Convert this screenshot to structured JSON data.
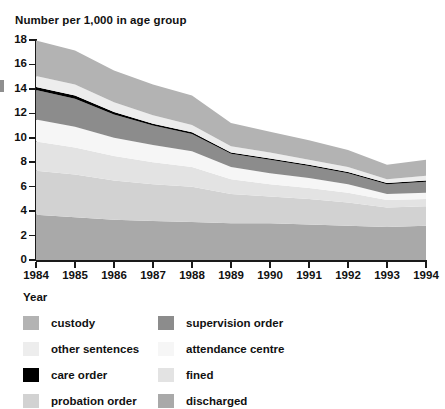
{
  "chart_data": {
    "type": "area",
    "stacked": true,
    "title": "Number per 1,000 in age group",
    "xlabel": "Year",
    "ylabel": "",
    "grid": false,
    "legend_position": "bottom",
    "x": [
      1984,
      1985,
      1986,
      1987,
      1988,
      1989,
      1990,
      1991,
      1992,
      1993,
      1994
    ],
    "categories": [
      "1984",
      "1985",
      "1986",
      "1987",
      "1988",
      "1989",
      "1990",
      "1991",
      "1992",
      "1993",
      "1994"
    ],
    "xlim": [
      1984,
      1994
    ],
    "ylim": [
      0,
      18
    ],
    "yticks": [
      0,
      2,
      4,
      6,
      8,
      10,
      12,
      14,
      16,
      18
    ],
    "series": [
      {
        "name": "discharged",
        "color": "#a9a9a9",
        "values": [
          3.7,
          3.5,
          3.3,
          3.2,
          3.1,
          3.0,
          3.0,
          2.9,
          2.8,
          2.7,
          2.8
        ]
      },
      {
        "name": "probation order",
        "color": "#d2d2d2",
        "values": [
          3.6,
          3.5,
          3.2,
          3.0,
          2.9,
          2.4,
          2.2,
          2.1,
          1.9,
          1.6,
          1.6
        ]
      },
      {
        "name": "fined",
        "color": "#e3e3e3",
        "values": [
          2.4,
          2.2,
          2.0,
          1.8,
          1.6,
          1.2,
          1.0,
          0.9,
          0.8,
          0.6,
          0.6
        ]
      },
      {
        "name": "attendance centre",
        "color": "#f6f6f6",
        "values": [
          1.8,
          1.7,
          1.5,
          1.4,
          1.3,
          1.0,
          0.9,
          0.8,
          0.7,
          0.5,
          0.5
        ]
      },
      {
        "name": "supervision order",
        "color": "#8c8c8c",
        "values": [
          2.4,
          2.3,
          1.9,
          1.6,
          1.4,
          1.1,
          1.1,
          1.0,
          0.9,
          0.8,
          0.9
        ]
      },
      {
        "name": "care order",
        "color": "#000000",
        "values": [
          0.25,
          0.25,
          0.2,
          0.15,
          0.15,
          0.1,
          0.1,
          0.1,
          0.1,
          0.1,
          0.1
        ]
      },
      {
        "name": "other sentences",
        "color": "#ededed",
        "values": [
          0.9,
          0.9,
          0.8,
          0.7,
          0.6,
          0.5,
          0.5,
          0.4,
          0.4,
          0.3,
          0.4
        ]
      },
      {
        "name": "custody",
        "color": "#b3b3b3",
        "values": [
          2.9,
          2.8,
          2.6,
          2.5,
          2.4,
          1.9,
          1.7,
          1.6,
          1.4,
          1.2,
          1.3
        ]
      }
    ],
    "totals": [
      17.95,
      17.15,
      15.5,
      14.35,
      13.45,
      11.2,
      10.5,
      9.8,
      9.0,
      7.8,
      8.2
    ]
  },
  "axes": {
    "y_labels": [
      "18",
      "16",
      "14",
      "12",
      "10",
      "8",
      "6",
      "4",
      "2",
      "0"
    ],
    "x_labels": [
      "1984",
      "1985",
      "1986",
      "1987",
      "1988",
      "1989",
      "1990",
      "1991",
      "1992",
      "1993",
      "1994"
    ],
    "x_title": "Year"
  },
  "legend": {
    "rows": [
      {
        "left": {
          "label": "custody",
          "color": "#b3b3b3"
        },
        "right": {
          "label": "supervision order",
          "color": "#8c8c8c"
        }
      },
      {
        "left": {
          "label": "other sentences",
          "color": "#ededed"
        },
        "right": {
          "label": "attendance centre",
          "color": "#f6f6f6"
        }
      },
      {
        "left": {
          "label": "care order",
          "color": "#000000"
        },
        "right": {
          "label": "fined",
          "color": "#e3e3e3"
        }
      },
      {
        "left": {
          "label": "probation order",
          "color": "#d2d2d2"
        },
        "right": {
          "label": "discharged",
          "color": "#a9a9a9"
        }
      }
    ]
  }
}
